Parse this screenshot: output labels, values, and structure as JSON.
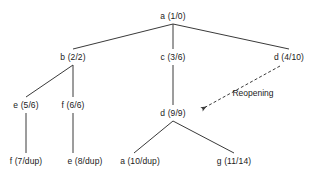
{
  "diagram": {
    "kind": "dfs-tree",
    "background_color": "#ffffff",
    "edge_color": "#3a3a3a",
    "text_color": "#1a1a1a",
    "nodes": [
      {
        "id": "a1",
        "label": "a (1/0)",
        "x": 173,
        "y": 16
      },
      {
        "id": "b2",
        "label": "b (2/2)",
        "x": 73,
        "y": 57
      },
      {
        "id": "c3",
        "label": "c (3/6)",
        "x": 173,
        "y": 57
      },
      {
        "id": "d4",
        "label": "d (4/10)",
        "x": 289,
        "y": 57
      },
      {
        "id": "e5",
        "label": "e (5/6)",
        "x": 26,
        "y": 105
      },
      {
        "id": "f6",
        "label": "f (6/6)",
        "x": 85,
        "y": 105
      },
      {
        "id": "d9",
        "label": "d (9/9)",
        "x": 188,
        "y": 113
      },
      {
        "id": "f7",
        "label": "f (7/dup)",
        "x": 26,
        "y": 161
      },
      {
        "id": "e8",
        "label": "e (8/dup)",
        "x": 85,
        "y": 161
      },
      {
        "id": "a10",
        "label": "a (10/dup)",
        "x": 140,
        "y": 161
      },
      {
        "id": "g11",
        "label": "g (11/14)",
        "x": 234,
        "y": 161
      }
    ],
    "edges": [
      {
        "from": "a1",
        "to": "b2",
        "style": "solid"
      },
      {
        "from": "a1",
        "to": "c3",
        "style": "solid"
      },
      {
        "from": "a1",
        "to": "d4",
        "style": "solid"
      },
      {
        "from": "b2",
        "to": "e5",
        "style": "solid"
      },
      {
        "from": "b2",
        "to": "f6",
        "style": "solid"
      },
      {
        "from": "c3",
        "to": "d9",
        "style": "solid"
      },
      {
        "from": "e5",
        "to": "f7",
        "style": "solid"
      },
      {
        "from": "f6",
        "to": "e8",
        "style": "solid"
      },
      {
        "from": "d9",
        "to": "a10",
        "style": "solid"
      },
      {
        "from": "d9",
        "to": "g11",
        "style": "solid"
      },
      {
        "from": "d4",
        "to": "d9",
        "style": "dashed-arrow"
      }
    ],
    "annotations": [
      {
        "id": "reopening",
        "label": "Reopening",
        "x": 253,
        "y": 93
      }
    ]
  }
}
